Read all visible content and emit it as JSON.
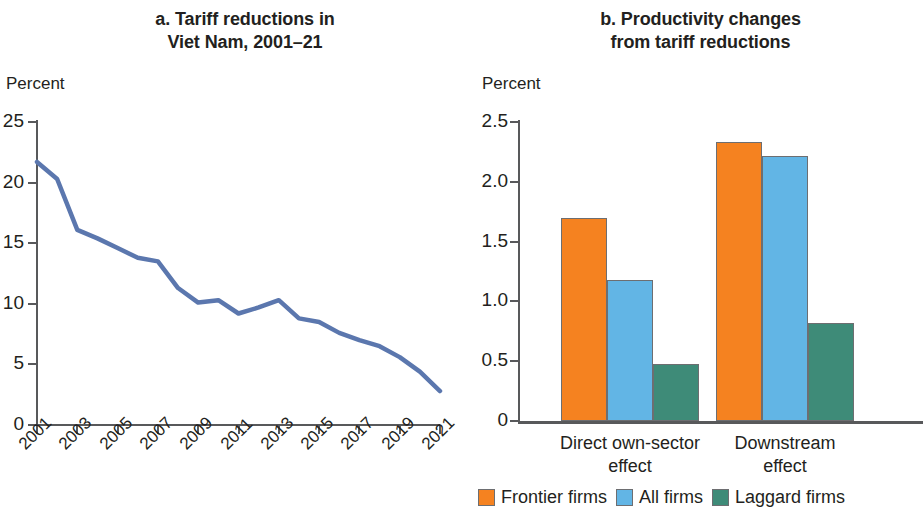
{
  "panel_a": {
    "title_line1": "a. Tariff reductions in",
    "title_line2": "Viet Nam, 2001–21",
    "axis_unit": "Percent",
    "y_ticks": [
      "0",
      "5",
      "10",
      "15",
      "20",
      "25"
    ],
    "x_ticks": [
      "2001",
      "2003",
      "2005",
      "2007",
      "2009",
      "2011",
      "2013",
      "2015",
      "2017",
      "2019",
      "2021"
    ]
  },
  "panel_b": {
    "title_line1": "b. Productivity changes",
    "title_line2": "from tariff reductions",
    "axis_unit": "Percent",
    "y_ticks": [
      "0",
      "0.5",
      "1.0",
      "1.5",
      "2.0",
      "2.5"
    ],
    "group_labels": [
      {
        "line1": "Direct own-sector",
        "line2": "effect"
      },
      {
        "line1": "Downstream",
        "line2": "effect"
      }
    ],
    "legend": [
      {
        "label": "Frontier firms",
        "color": "#F58220"
      },
      {
        "label": "All firms",
        "color": "#62B5E5"
      },
      {
        "label": "Laggard firms",
        "color": "#3E8B78"
      }
    ]
  },
  "colors": {
    "line": "#5B77AE",
    "frontier": "#F58220",
    "all_firms": "#62B5E5",
    "laggard": "#3E8B78",
    "axis": "#58595b",
    "text": "#231f20"
  },
  "chart_data": [
    {
      "type": "line",
      "panel": "a",
      "title": "a. Tariff reductions in Viet Nam, 2001–21",
      "xlabel": "",
      "ylabel": "Percent",
      "ylim": [
        0,
        25
      ],
      "yticks": [
        0,
        5,
        10,
        15,
        20,
        25
      ],
      "xlim": [
        2001,
        2021
      ],
      "xticks": [
        2001,
        2003,
        2005,
        2007,
        2009,
        2011,
        2013,
        2015,
        2017,
        2019,
        2021
      ],
      "grid": false,
      "legend": "none",
      "series": [
        {
          "name": "Average tariff",
          "color": "#5B77AE",
          "x": [
            2001,
            2002,
            2003,
            2004,
            2005,
            2006,
            2007,
            2008,
            2009,
            2010,
            2011,
            2012,
            2013,
            2014,
            2015,
            2016,
            2017,
            2018,
            2019,
            2020,
            2021
          ],
          "values": [
            21.7,
            20.3,
            16.1,
            15.4,
            14.6,
            13.8,
            13.5,
            11.3,
            10.1,
            10.3,
            9.2,
            9.7,
            10.3,
            8.8,
            8.5,
            7.6,
            7.0,
            6.5,
            5.6,
            4.4,
            2.8
          ]
        }
      ]
    },
    {
      "type": "bar",
      "panel": "b",
      "title": "b. Productivity changes from tariff reductions",
      "xlabel": "",
      "ylabel": "Percent",
      "ylim": [
        0,
        2.5
      ],
      "yticks": [
        0,
        0.5,
        1.0,
        1.5,
        2.0,
        2.5
      ],
      "grid": false,
      "legend": "bottom",
      "categories": [
        "Direct own-sector effect",
        "Downstream effect"
      ],
      "series": [
        {
          "name": "Frontier firms",
          "color": "#F58220",
          "values": [
            1.7,
            2.33
          ]
        },
        {
          "name": "All firms",
          "color": "#62B5E5",
          "values": [
            1.18,
            2.22
          ]
        },
        {
          "name": "Laggard firms",
          "color": "#3E8B78",
          "values": [
            0.48,
            0.82
          ]
        }
      ]
    }
  ]
}
